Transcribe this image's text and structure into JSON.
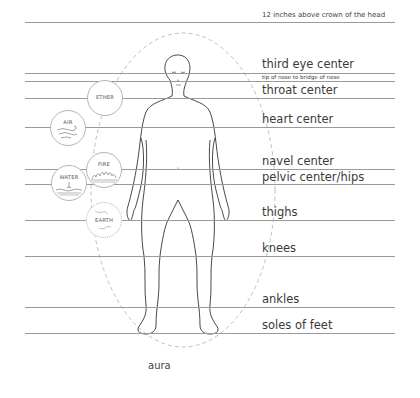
{
  "diagram": {
    "levels": [
      {
        "id": "crown",
        "label": "12 inches above crown of the head",
        "y": 22,
        "size": "small",
        "label_top": 12
      },
      {
        "id": "third-eye",
        "label": "third eye center",
        "y": 73,
        "size": "big",
        "label_top": 59
      },
      {
        "id": "nose",
        "label": "tip of nose to bridge of nose",
        "y": 81,
        "size": "tiny",
        "label_top": 75
      },
      {
        "id": "throat",
        "label": "throat center",
        "y": 98,
        "size": "big",
        "label_top": 85
      },
      {
        "id": "heart",
        "label": "heart center",
        "y": 127,
        "size": "big",
        "label_top": 114
      },
      {
        "id": "navel",
        "label": "navel center",
        "y": 169,
        "size": "big",
        "label_top": 156
      },
      {
        "id": "pelvic",
        "label": "pelvic center/hips",
        "y": 184,
        "size": "big",
        "label_top": 172
      },
      {
        "id": "thighs",
        "label": "thighs",
        "y": 220,
        "size": "big",
        "label_top": 207
      },
      {
        "id": "knees",
        "label": "knees",
        "y": 256,
        "size": "big",
        "label_top": 243
      },
      {
        "id": "ankles",
        "label": "ankles",
        "y": 307,
        "size": "big",
        "label_top": 294
      },
      {
        "id": "soles",
        "label": "soles of feet",
        "y": 333,
        "size": "big",
        "label_top": 320
      }
    ],
    "elements": [
      {
        "id": "ether",
        "label": "ETHER",
        "x": 87,
        "y": 80,
        "icon": "ether-icon"
      },
      {
        "id": "air",
        "label": "AIR",
        "x": 50,
        "y": 110,
        "icon": "wind-icon"
      },
      {
        "id": "fire",
        "label": "FIRE",
        "x": 86,
        "y": 152,
        "icon": "flame-icon"
      },
      {
        "id": "water",
        "label": "WATER",
        "x": 51,
        "y": 165,
        "icon": "water-drop-icon"
      },
      {
        "id": "earth",
        "label": "EARTH",
        "x": 86,
        "y": 202,
        "icon": "globe-icon"
      }
    ],
    "aura_label": "aura",
    "colors": {
      "line": "#9a9a9a",
      "figure_stroke": "#333333",
      "aura_dash": "#b0b0b0",
      "text": "#3a3a3a"
    }
  }
}
